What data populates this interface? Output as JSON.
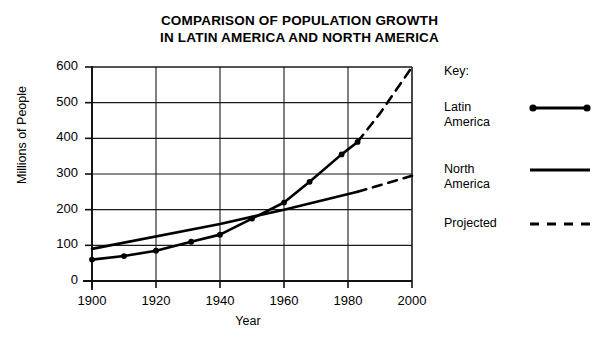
{
  "title": {
    "line1": "COMPARISON OF POPULATION GROWTH",
    "line2": "IN LATIN AMERICA AND NORTH AMERICA"
  },
  "key": {
    "heading": "Key:",
    "entries": [
      {
        "label_line1": "Latin",
        "label_line2": "America",
        "style": "line-with-dots"
      },
      {
        "label_line1": "North",
        "label_line2": "America",
        "style": "solid-line"
      },
      {
        "label_line1": "Projected",
        "label_line2": "",
        "style": "dashed-line"
      }
    ]
  },
  "chart_data": {
    "type": "line",
    "title": "COMPARISON OF POPULATION GROWTH IN LATIN AMERICA AND NORTH AMERICA",
    "xlabel": "Year",
    "ylabel": "Millions of People",
    "xlim": [
      1900,
      2000
    ],
    "ylim": [
      0,
      600
    ],
    "xticks": [
      1900,
      1920,
      1940,
      1960,
      1980,
      2000
    ],
    "yticks": [
      0,
      100,
      200,
      300,
      400,
      500,
      600
    ],
    "grid": true,
    "legend_position": "right",
    "series": [
      {
        "name": "Latin America",
        "marker": "dot",
        "linestyle": "solid",
        "x": [
          1900,
          1910,
          1920,
          1931,
          1940,
          1950,
          1960,
          1968,
          1978,
          1983
        ],
        "y": [
          60,
          70,
          85,
          110,
          130,
          175,
          220,
          278,
          355,
          390
        ]
      },
      {
        "name": "Latin America (projected)",
        "marker": "none",
        "linestyle": "dashed",
        "x": [
          1983,
          1990,
          2000
        ],
        "y": [
          390,
          470,
          600
        ]
      },
      {
        "name": "North America",
        "marker": "none",
        "linestyle": "solid",
        "x": [
          1900,
          1940,
          1960,
          1983
        ],
        "y": [
          90,
          160,
          200,
          250
        ]
      },
      {
        "name": "North America (projected)",
        "marker": "none",
        "linestyle": "dashed",
        "x": [
          1983,
          2000
        ],
        "y": [
          250,
          295
        ]
      }
    ]
  }
}
